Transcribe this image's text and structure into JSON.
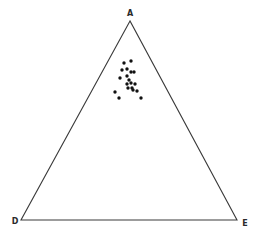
{
  "diagram": {
    "type": "ternary-diagram",
    "colors": {
      "background": "#ffffff",
      "line": "#3a3a3a",
      "point": "#111111"
    },
    "vertices": [
      {
        "label": "A",
        "x": 130,
        "y": 21,
        "label_x": 130,
        "label_y": 14
      },
      {
        "label": "D",
        "x": 21,
        "y": 220,
        "label_x": 15,
        "label_y": 222
      },
      {
        "label": "E",
        "x": 237,
        "y": 220,
        "label_x": 245,
        "label_y": 224
      }
    ],
    "points": [
      [
        124,
        63
      ],
      [
        131,
        61
      ],
      [
        122,
        70
      ],
      [
        127,
        69
      ],
      [
        131,
        72
      ],
      [
        134,
        72
      ],
      [
        120,
        78
      ],
      [
        127,
        76
      ],
      [
        129,
        80
      ],
      [
        127,
        84
      ],
      [
        131,
        83
      ],
      [
        135,
        84
      ],
      [
        128,
        88
      ],
      [
        132,
        88
      ],
      [
        137,
        91
      ],
      [
        133,
        90
      ],
      [
        115,
        92
      ],
      [
        119,
        98
      ],
      [
        141,
        98
      ]
    ]
  }
}
